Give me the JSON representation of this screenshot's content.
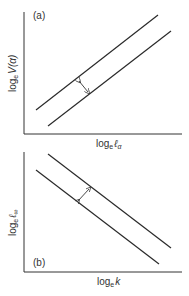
{
  "colors": {
    "line": "#2a2a2a",
    "axis": "#333333",
    "text": "#333333",
    "background": "#ffffff"
  },
  "panels": [
    {
      "id": "a",
      "label": "(a)",
      "xlabel": {
        "base": "log",
        "sub": "e",
        "var": "ℓ",
        "varsub": "α"
      },
      "ylabel": {
        "base": "log",
        "sub": "e",
        "var": "V(α)"
      },
      "lines": [
        "upper",
        "lower"
      ],
      "trend": "positive slope, parallel",
      "arrow": "double-headed arrow indicating vertical separation between lines"
    },
    {
      "id": "b",
      "label": "(b)",
      "xlabel": {
        "base": "log",
        "sub": "e",
        "var": "k"
      },
      "ylabel": {
        "base": "log",
        "sub": "e",
        "var": "ℓ",
        "varsub": "∞"
      },
      "lines": [
        "upper",
        "lower"
      ],
      "trend": "negative slope, parallel",
      "arrow": "double-headed arrow indicating separation between lines"
    }
  ]
}
